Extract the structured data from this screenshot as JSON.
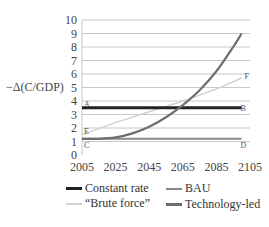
{
  "chart_data": {
    "type": "line",
    "title": "",
    "xlabel": "",
    "ylabel": "−Δ(C/GDP)",
    "xlim": [
      2005,
      2105
    ],
    "ylim": [
      0,
      10
    ],
    "grid": true,
    "legend_position": "bottom",
    "x_ticks": [
      "2005",
      "2025",
      "2045",
      "2065",
      "2085",
      "2105"
    ],
    "y_ticks": [
      "0",
      "1",
      "2",
      "3",
      "4",
      "5",
      "6",
      "7",
      "8",
      "9",
      "10"
    ],
    "series": [
      {
        "name": "Constant rate",
        "color": "#222222",
        "x": [
          2005,
          2100
        ],
        "values": [
          3.5,
          3.5
        ],
        "start_label": "A",
        "end_label": "B"
      },
      {
        "name": "BAU",
        "color": "#8a8a8a",
        "x": [
          2005,
          2100
        ],
        "values": [
          1.2,
          1.2
        ],
        "start_label": "C",
        "end_label": "D"
      },
      {
        "name": "“Brute force”",
        "color": "#cfcfcf",
        "x": [
          2005,
          2025,
          2045,
          2065,
          2085,
          2100
        ],
        "values": [
          1.5,
          2.4,
          3.2,
          4.0,
          4.9,
          5.7
        ],
        "start_label": "E",
        "end_label": "F"
      },
      {
        "name": "Technology-led",
        "color": "#6e6e6e",
        "x": [
          2005,
          2015,
          2025,
          2035,
          2045,
          2055,
          2065,
          2075,
          2085,
          2095,
          2100
        ],
        "values": [
          1.2,
          1.2,
          1.3,
          1.6,
          2.1,
          2.8,
          3.7,
          4.8,
          6.2,
          8.0,
          9.0
        ]
      }
    ],
    "annotations": [
      "A",
      "B",
      "C",
      "D",
      "E",
      "F"
    ]
  },
  "legend": {
    "items": [
      {
        "label": "Constant rate"
      },
      {
        "label": "BAU"
      },
      {
        "label": "“Brute force”"
      },
      {
        "label": "Technology-led"
      }
    ]
  }
}
